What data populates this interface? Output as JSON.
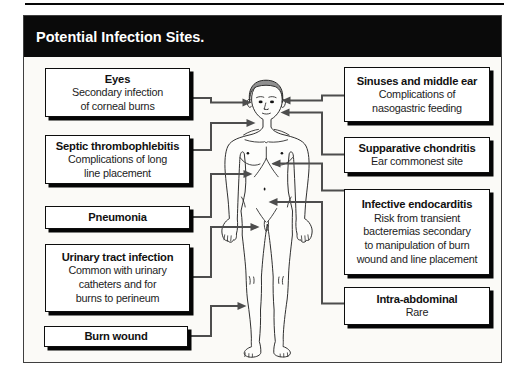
{
  "title_bar": {
    "label": "Potential Infection Sites."
  },
  "left_boxes": [
    {
      "title": "Eyes",
      "lines": [
        "Secondary infection",
        "of corneal burns"
      ]
    },
    {
      "title": "Septic thrombophlebitis",
      "lines": [
        "Complications of long",
        "line placement"
      ]
    },
    {
      "title": "Pneumonia",
      "lines": []
    },
    {
      "title": "Urinary tract infection",
      "lines": [
        "Common with urinary",
        "catheters and for",
        "burns to perineum"
      ]
    },
    {
      "title": "Burn wound",
      "lines": []
    }
  ],
  "right_boxes": [
    {
      "title": "Sinuses and middle ear",
      "lines": [
        "Complications of",
        "nasogastric feeding"
      ]
    },
    {
      "title": "Supparative chondritis",
      "lines": [
        "Ear commonest site"
      ]
    },
    {
      "title": "Infective endocarditis",
      "lines": [
        "Risk from transient",
        "bacteremias secondary",
        "to manipulation of burn",
        "wound and line placement"
      ]
    },
    {
      "title": "Intra-abdominal",
      "lines": [
        "Rare"
      ]
    }
  ],
  "colors": {
    "title_bar_bg": "#0a0a0a",
    "title_text": "#ffffff",
    "box_border": "#0d0d0d",
    "box_shadow": "#050505",
    "connector_gray": "#4d4d4d",
    "panel_bg": "#fbfaf7",
    "hair_gray": "#8f8f8f"
  }
}
